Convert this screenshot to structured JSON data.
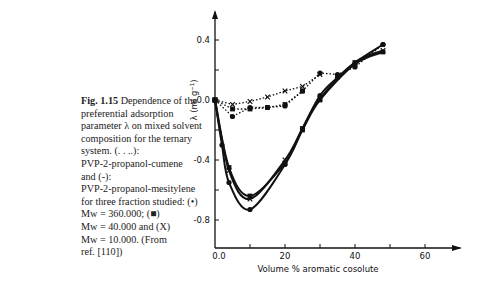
{
  "caption": {
    "fig_label": "Fig. 1.15",
    "lines": [
      "Dependence of the",
      "preferential adsorption",
      "parameter λ on mixed solvent",
      "composition for the ternary",
      "system. (. . ..):",
      "PVP-2-propanol-cumene",
      "and (-):",
      "PVP-2-propanol-mesitylene",
      "for three fraction studied: (•)",
      "Mw = 360.000; (■)",
      "Mw = 40.000 and (X)",
      "Mw = 10.000. (From",
      "ref. [110])"
    ]
  },
  "chart_data": {
    "type": "line",
    "title": "",
    "xlabel": "Volume % aromatic cosolute",
    "ylabel": "λ (ml g⁻¹)",
    "xlim": [
      0,
      70
    ],
    "ylim": [
      -1.0,
      0.55
    ],
    "x_ticks": [
      "0.0",
      "20",
      "40",
      "60"
    ],
    "y_ticks": [
      "0.4",
      "0.0",
      "-0.4",
      "-0.8"
    ],
    "grid": false,
    "legend": "in caption",
    "series": [
      {
        "name": "cumene Mw=360.000 (•)",
        "style": "dotted",
        "marker": "circle",
        "x": [
          0,
          5,
          10,
          15,
          20,
          25,
          30,
          35,
          40,
          48
        ],
        "y": [
          0.0,
          -0.11,
          -0.05,
          -0.05,
          -0.04,
          0.06,
          0.18,
          0.17,
          0.22,
          0.37
        ]
      },
      {
        "name": "cumene Mw=40.000 (■)",
        "style": "dotted",
        "marker": "square",
        "x": [
          0,
          5,
          10,
          15,
          20,
          25
        ],
        "y": [
          0.0,
          -0.06,
          -0.06,
          -0.05,
          -0.03,
          0.06
        ]
      },
      {
        "name": "cumene Mw=10.000 (X)",
        "style": "dotted",
        "marker": "x",
        "x": [
          0,
          5,
          10,
          15,
          20,
          25,
          30
        ],
        "y": [
          0.0,
          -0.03,
          -0.01,
          0.02,
          0.06,
          0.09,
          0.17
        ]
      },
      {
        "name": "mesitylene Mw=360.000 (•)",
        "style": "solid",
        "marker": "circle",
        "x": [
          0,
          2,
          4,
          10,
          20,
          25,
          30,
          35,
          40,
          48
        ],
        "y": [
          0.0,
          -0.3,
          -0.55,
          -0.73,
          -0.43,
          -0.19,
          0.03,
          0.15,
          0.25,
          0.37
        ]
      },
      {
        "name": "mesitylene Mw=40.000 (■)",
        "style": "solid",
        "marker": "square",
        "x": [
          0,
          4,
          10,
          20,
          25,
          30,
          40,
          48
        ],
        "y": [
          0.0,
          -0.45,
          -0.64,
          -0.42,
          -0.2,
          0.0,
          0.24,
          0.32
        ]
      },
      {
        "name": "mesitylene Mw=10.000 (X)",
        "style": "solid",
        "marker": "x",
        "x": [
          0,
          4,
          10,
          20,
          25,
          30,
          40,
          48
        ],
        "y": [
          0.0,
          -0.47,
          -0.66,
          -0.4,
          -0.19,
          0.01,
          0.25,
          0.33
        ]
      }
    ]
  }
}
